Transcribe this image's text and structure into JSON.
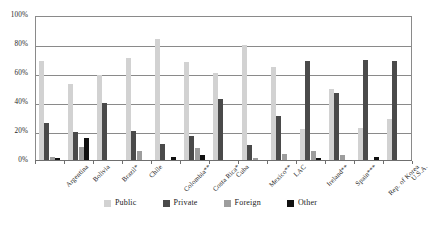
{
  "chart_data": {
    "type": "bar",
    "title": "",
    "subtitle": "",
    "xlabel": "",
    "ylabel": "",
    "ylim": [
      0,
      100
    ],
    "yticks": [
      0,
      20,
      40,
      60,
      80,
      100
    ],
    "ytick_labels": [
      "0%",
      "20%",
      "40%",
      "60%",
      "80%",
      "100%"
    ],
    "grid": true,
    "legend_position": "bottom",
    "categories": [
      "Argentina",
      "Bolivia",
      "Brazil*",
      "Chile",
      "Colombia**",
      "Costa Rica*",
      "Cuba",
      "Mexico**",
      "LAC",
      "Ireland**",
      "Spain***",
      "Rep. of Korea",
      "U.S.A."
    ],
    "series": [
      {
        "name": "Public",
        "color": "#d2d2d2",
        "values": [
          69,
          53,
          59,
          71,
          84,
          68,
          61,
          80,
          65,
          22,
          50,
          23,
          29
        ]
      },
      {
        "name": "Private",
        "color": "#4a4a4a",
        "values": [
          26,
          20,
          40,
          21,
          12,
          17,
          43,
          11,
          31,
          69,
          47,
          70,
          69
        ]
      },
      {
        "name": "Foreign",
        "color": "#9d9d9d",
        "values": [
          3,
          10,
          0,
          7,
          1,
          9,
          0,
          2,
          5,
          7,
          4,
          0,
          0
        ]
      },
      {
        "name": "Other",
        "color": "#111111",
        "values": [
          2,
          16,
          0,
          0,
          3,
          4,
          1,
          1,
          1,
          2,
          0,
          3,
          1
        ]
      }
    ]
  },
  "legend": {
    "items": [
      {
        "label": "Public",
        "color": "#d2d2d2"
      },
      {
        "label": "Private",
        "color": "#4a4a4a"
      },
      {
        "label": "Foreign",
        "color": "#9d9d9d"
      },
      {
        "label": "Other",
        "color": "#111111"
      }
    ]
  }
}
